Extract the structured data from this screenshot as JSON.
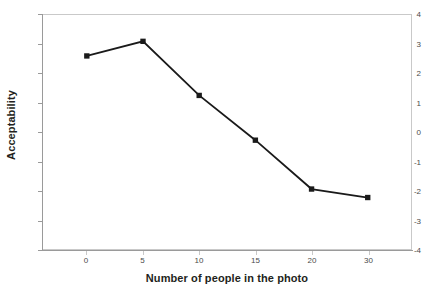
{
  "chart_data": {
    "type": "line",
    "title": "",
    "xlabel": "Number of people in the photo",
    "ylabel": "Acceptability",
    "categories": [
      "0",
      "5",
      "10",
      "15",
      "20",
      "30"
    ],
    "values": [
      2.6,
      3.1,
      1.25,
      -0.28,
      -1.95,
      -2.24
    ],
    "series": [
      {
        "name": "Acceptability",
        "values": [
          2.6,
          3.1,
          1.25,
          -0.28,
          -1.95,
          -2.24
        ]
      }
    ],
    "ylim": [
      -4,
      4
    ],
    "yticks": [
      "4",
      "3",
      "2",
      "1",
      "0",
      "-1",
      "-2",
      "-3",
      "-4"
    ],
    "ytick_values": [
      4,
      3,
      2,
      1,
      0,
      -1,
      -2,
      -3,
      -4
    ],
    "xticks": [
      "0",
      "5",
      "10",
      "15",
      "20",
      "30"
    ],
    "grid": false,
    "legend": "none",
    "marker": "square",
    "line_color": "#1a1a1a",
    "marker_color": "#1a1a1a",
    "plot_background": "#ffffff",
    "axis_color": "#9a9a9a",
    "text_color": "#231f20"
  }
}
